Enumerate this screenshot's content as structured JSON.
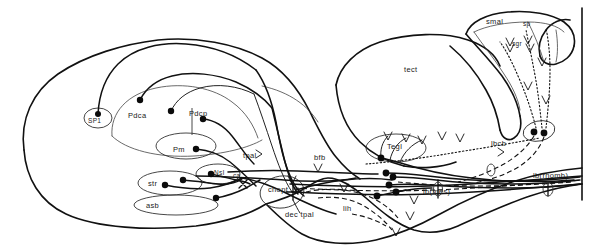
{
  "figure": {
    "background_color": "#ffffff",
    "ink_color": "#111111",
    "width": 596,
    "height": 252
  },
  "labels": [
    {
      "id": "sp1",
      "text": "SP1",
      "x": 88,
      "y": 118,
      "size": "sm"
    },
    {
      "id": "pdca",
      "text": "Pdca",
      "x": 128,
      "y": 112,
      "size": "md"
    },
    {
      "id": "pdcp",
      "text": "Pdcp",
      "x": 189,
      "y": 110,
      "size": "md"
    },
    {
      "id": "pm",
      "text": "Pm",
      "x": 173,
      "y": 146,
      "size": "md"
    },
    {
      "id": "str",
      "text": "str",
      "x": 148,
      "y": 180,
      "size": "md"
    },
    {
      "id": "nsl",
      "text": "Nsl",
      "x": 214,
      "y": 174,
      "size": "sm"
    },
    {
      "id": "ca",
      "text": "ca",
      "x": 233,
      "y": 177,
      "size": "sm"
    },
    {
      "id": "asb",
      "text": "asb",
      "x": 146,
      "y": 206,
      "size": "md"
    },
    {
      "id": "tpal",
      "text": "tpal",
      "x": 243,
      "y": 155,
      "size": "md"
    },
    {
      "id": "bfb",
      "text": "bfb",
      "x": 314,
      "y": 158,
      "size": "md"
    },
    {
      "id": "chopt",
      "text": "chopt",
      "x": 268,
      "y": 186,
      "size": "md"
    },
    {
      "id": "dec_tpal",
      "text": "dec tpal",
      "x": 285,
      "y": 213,
      "size": "md"
    },
    {
      "id": "lih",
      "text": "lih",
      "x": 343,
      "y": 208,
      "size": "md"
    },
    {
      "id": "tect",
      "text": "tect",
      "x": 404,
      "y": 69,
      "size": "md"
    },
    {
      "id": "tegl",
      "text": "Tegl",
      "x": 387,
      "y": 147,
      "size": "md"
    },
    {
      "id": "lbcb",
      "text": "lbcb",
      "x": 491,
      "y": 144,
      "size": "md"
    },
    {
      "id": "lbmes",
      "text": "lb(mes)",
      "x": 423,
      "y": 189,
      "size": "md"
    },
    {
      "id": "lbrhomb",
      "text": "lb(rhomb)",
      "x": 533,
      "y": 176,
      "size": "md"
    },
    {
      "id": "smal",
      "text": "smal",
      "x": 486,
      "y": 20,
      "size": "md"
    },
    {
      "id": "sp",
      "text": "sp",
      "x": 523,
      "y": 23,
      "size": "sm"
    },
    {
      "id": "sgr",
      "text": "sgr",
      "x": 512,
      "y": 44,
      "size": "sm"
    }
  ],
  "regions": [
    {
      "id": "telencephalon",
      "name": "telencephalon-outline"
    },
    {
      "id": "tectum",
      "name": "tectum-outline"
    },
    {
      "id": "cerebellum",
      "name": "cerebellum-outline"
    },
    {
      "id": "brainstem",
      "name": "brainstem-outline"
    }
  ],
  "pathway_types": [
    {
      "id": "solid",
      "name": "solid-tract",
      "style": "solid"
    },
    {
      "id": "dashed",
      "name": "dashed-tract",
      "style": "dashed"
    },
    {
      "id": "dotted",
      "name": "dotted-tract",
      "style": "dotted"
    }
  ],
  "somata": [
    {
      "id": "soma-sp1",
      "x": 98,
      "y": 114,
      "r": 3.0
    },
    {
      "id": "soma-pdca",
      "x": 140,
      "y": 100,
      "r": 3.2
    },
    {
      "id": "soma-pdcp1",
      "x": 171,
      "y": 111,
      "r": 3.2
    },
    {
      "id": "soma-pdcp2",
      "x": 203,
      "y": 119,
      "r": 3.2
    },
    {
      "id": "soma-pm",
      "x": 196,
      "y": 149,
      "r": 3.2
    },
    {
      "id": "soma-str1",
      "x": 165,
      "y": 185,
      "r": 3.2
    },
    {
      "id": "soma-str2",
      "x": 183,
      "y": 180,
      "r": 3.2
    },
    {
      "id": "soma-nsl",
      "x": 211,
      "y": 174,
      "r": 3.2
    },
    {
      "id": "soma-asb",
      "x": 216,
      "y": 198,
      "r": 3.2
    },
    {
      "id": "soma-teg1",
      "x": 381,
      "y": 158,
      "r": 3.4
    },
    {
      "id": "soma-teg2",
      "x": 389,
      "y": 185,
      "r": 3.4
    },
    {
      "id": "soma-teg3",
      "x": 386,
      "y": 173,
      "r": 3.4
    },
    {
      "id": "soma-teg4",
      "x": 396,
      "y": 192,
      "r": 3.4
    },
    {
      "id": "soma-teg5",
      "x": 377,
      "y": 196,
      "r": 3.4
    },
    {
      "id": "soma-teg6",
      "x": 393,
      "y": 177,
      "r": 3.4
    },
    {
      "id": "soma-cb1",
      "x": 534,
      "y": 132,
      "r": 3.4
    },
    {
      "id": "soma-cb2",
      "x": 544,
      "y": 133,
      "r": 3.4
    }
  ]
}
